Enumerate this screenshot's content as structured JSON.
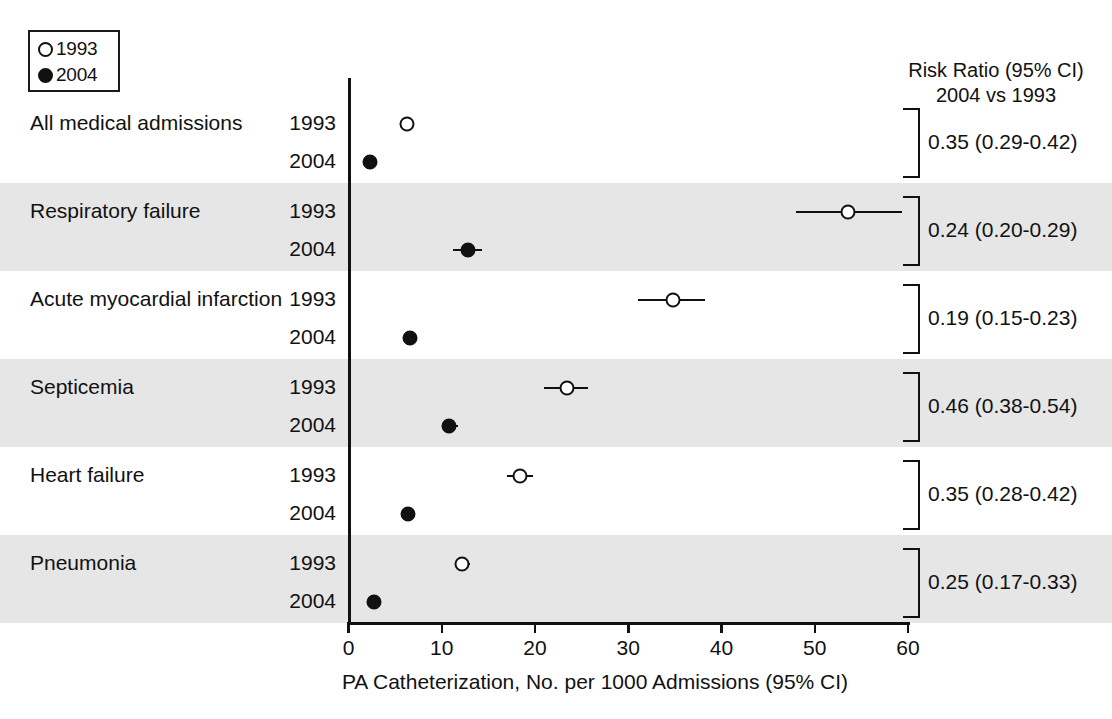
{
  "legend": {
    "entries": [
      {
        "marker": "open-circle",
        "label": "1993"
      },
      {
        "marker": "filled-circle",
        "label": "2004"
      }
    ]
  },
  "right_column": {
    "header_line1": "Risk Ratio (95% CI)",
    "header_line2": "2004 vs 1993"
  },
  "axis": {
    "title": "PA Catheterization, No. per 1000 Admissions (95% CI)",
    "ticks": [
      "0",
      "10",
      "20",
      "30",
      "40",
      "50",
      "60"
    ],
    "min": 0,
    "max": 60
  },
  "year_labels": {
    "old": "1993",
    "new": "2004"
  },
  "caption_ghost": "",
  "watermark": {
    "line1": "",
    "line2": ""
  },
  "chart_data": {
    "type": "scatter",
    "xlabel": "PA Catheterization, No. per 1000 Admissions (95% CI)",
    "ylabel": "",
    "xlim": [
      0,
      60
    ],
    "xticks": [
      0,
      10,
      20,
      30,
      40,
      50,
      60
    ],
    "grid": false,
    "legend_position": "top-left",
    "series": [
      {
        "name": "1993",
        "marker": "open-circle"
      },
      {
        "name": "2004",
        "marker": "filled-circle"
      }
    ],
    "categories": [
      "All medical admissions",
      "Respiratory failure",
      "Acute myocardial infarction",
      "Septicemia",
      "Heart failure",
      "Pneumonia"
    ],
    "rows": [
      {
        "category": "All medical admissions",
        "shaded": false,
        "y1993": {
          "value": 6.3,
          "ci_low": 6.0,
          "ci_high": 6.6
        },
        "y2004": {
          "value": 2.3,
          "ci_low": 2.2,
          "ci_high": 2.4
        },
        "risk_ratio": "0.35 (0.29-0.42)",
        "rr_value": 0.35,
        "rr_low": 0.29,
        "rr_high": 0.42
      },
      {
        "category": "Respiratory failure",
        "shaded": true,
        "y1993": {
          "value": 53.6,
          "ci_low": 48.0,
          "ci_high": 59.4
        },
        "y2004": {
          "value": 12.8,
          "ci_low": 11.2,
          "ci_high": 14.3
        },
        "risk_ratio": "0.24 (0.20-0.29)",
        "rr_value": 0.24,
        "rr_low": 0.2,
        "rr_high": 0.29
      },
      {
        "category": "Acute myocardial infarction",
        "shaded": false,
        "y1993": {
          "value": 34.8,
          "ci_low": 31.0,
          "ci_high": 38.2
        },
        "y2004": {
          "value": 6.6,
          "ci_low": 6.0,
          "ci_high": 7.2
        },
        "risk_ratio": "0.19 (0.15-0.23)",
        "rr_value": 0.19,
        "rr_low": 0.15,
        "rr_high": 0.23
      },
      {
        "category": "Septicemia",
        "shaded": true,
        "y1993": {
          "value": 23.4,
          "ci_low": 21.0,
          "ci_high": 25.7
        },
        "y2004": {
          "value": 10.8,
          "ci_low": 10.0,
          "ci_high": 11.7
        },
        "risk_ratio": "0.46 (0.38-0.54)",
        "rr_value": 0.46,
        "rr_low": 0.38,
        "rr_high": 0.54
      },
      {
        "category": "Heart failure",
        "shaded": false,
        "y1993": {
          "value": 18.4,
          "ci_low": 17.0,
          "ci_high": 19.8
        },
        "y2004": {
          "value": 6.4,
          "ci_low": 5.9,
          "ci_high": 7.0
        },
        "risk_ratio": "0.35 (0.28-0.42)",
        "rr_value": 0.35,
        "rr_low": 0.28,
        "rr_high": 0.42
      },
      {
        "category": "Pneumonia",
        "shaded": true,
        "y1993": {
          "value": 12.2,
          "ci_low": 11.5,
          "ci_high": 13.0
        },
        "y2004": {
          "value": 2.7,
          "ci_low": 2.5,
          "ci_high": 3.0
        },
        "risk_ratio": "0.25 (0.17-0.33)",
        "rr_value": 0.25,
        "rr_low": 0.17,
        "rr_high": 0.33
      }
    ]
  }
}
